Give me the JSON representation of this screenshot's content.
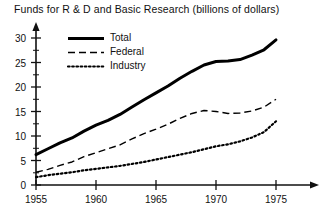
{
  "chart_data": {
    "type": "line",
    "title": "Funds for R & D and Basic Research (billions of dollars)",
    "xlabel": "",
    "ylabel": "",
    "xlim": [
      1955,
      1975
    ],
    "ylim": [
      0,
      32
    ],
    "grid": false,
    "legend_position": "upper-left",
    "xticks": [
      "1955",
      "1960",
      "1965",
      "1970",
      "1975"
    ],
    "xtick_values": [
      1955,
      1960,
      1965,
      1970,
      1975
    ],
    "yticks": [
      "0",
      "5",
      "10",
      "15",
      "20",
      "25",
      "30"
    ],
    "ytick_values": [
      0,
      5,
      10,
      15,
      20,
      25,
      30
    ],
    "x": [
      1955,
      1956,
      1957,
      1958,
      1959,
      1960,
      1961,
      1962,
      1963,
      1964,
      1965,
      1966,
      1967,
      1968,
      1969,
      1970,
      1971,
      1972,
      1973,
      1974,
      1975
    ],
    "series": [
      {
        "name": "Total",
        "style": "solid",
        "color": "#000000",
        "values": [
          6.2,
          7.4,
          8.6,
          9.6,
          11.0,
          12.2,
          13.2,
          14.4,
          15.9,
          17.4,
          18.8,
          20.2,
          21.8,
          23.2,
          24.5,
          25.2,
          25.3,
          25.6,
          26.5,
          27.6,
          29.6
        ]
      },
      {
        "name": "Federal",
        "style": "dashed",
        "color": "#000000",
        "values": [
          2.6,
          3.2,
          4.0,
          4.7,
          5.8,
          6.6,
          7.4,
          8.2,
          9.4,
          10.5,
          11.4,
          12.4,
          13.6,
          14.6,
          15.2,
          15.0,
          14.6,
          14.7,
          15.1,
          15.9,
          17.5
        ]
      },
      {
        "name": "Industry",
        "style": "dotted",
        "color": "#000000",
        "values": [
          1.6,
          2.0,
          2.3,
          2.6,
          3.0,
          3.3,
          3.6,
          3.9,
          4.3,
          4.7,
          5.2,
          5.7,
          6.2,
          6.7,
          7.3,
          7.9,
          8.3,
          8.9,
          9.7,
          10.8,
          13.0
        ]
      }
    ],
    "legend": [
      {
        "label": "Total",
        "style": "solid"
      },
      {
        "label": "Federal",
        "style": "dashed"
      },
      {
        "label": "Industry",
        "style": "dotted"
      }
    ]
  },
  "axes": {
    "y_arrow": "up-arrow-icon",
    "x_arrow": "right-arrow-icon"
  }
}
